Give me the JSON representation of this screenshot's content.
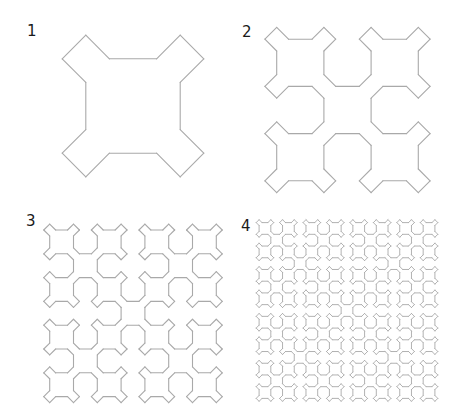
{
  "figure": {
    "line_color": "#a9a9a9",
    "background": "#ffffff",
    "panels": [
      {
        "label": "1",
        "order": 1,
        "center": [
          133,
          106
        ],
        "unit": 23.6,
        "label_pos": [
          27,
          24
        ]
      },
      {
        "label": "2",
        "order": 2,
        "center": [
          347.5,
          110
        ],
        "unit": 11.8,
        "label_pos": [
          242,
          25
        ]
      },
      {
        "label": "3",
        "order": 3,
        "center": [
          133,
          313.3
        ],
        "unit": 5.95,
        "label_pos": [
          26,
          214
        ]
      },
      {
        "label": "4",
        "order": 4,
        "center": [
          347,
          310.5
        ],
        "unit": 2.93,
        "label_pos": [
          241,
          219
        ]
      }
    ]
  }
}
